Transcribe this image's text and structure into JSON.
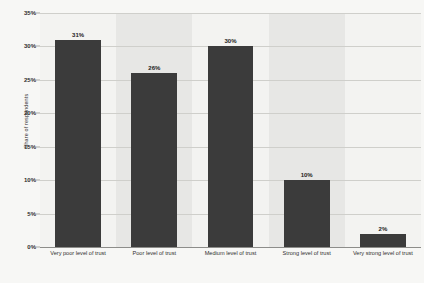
{
  "chart_data": {
    "type": "bar",
    "title": "",
    "subtitle": "",
    "xlabel": "",
    "ylabel": "Share of respondents",
    "ylim": [
      0,
      35
    ],
    "grid": true,
    "legend": "none",
    "categories": [
      "Very poor level of trust",
      "Poor level of trust",
      "Medium level of trust",
      "Strong level of trust",
      "Very strong level of trust"
    ],
    "values": [
      31,
      26,
      30,
      10,
      2
    ],
    "value_labels": [
      "31%",
      "26%",
      "30%",
      "10%",
      "2%"
    ],
    "ytick_values": [
      35,
      30,
      25,
      20,
      15,
      10,
      5,
      0
    ],
    "ytick_labels": [
      "35%",
      "30%",
      "25%",
      "20%",
      "15%",
      "10%",
      "5%",
      "0%"
    ],
    "colors": {
      "bar": "#3b3b3b",
      "band_light": "#f3f3f1",
      "band_dark": "#e7e7e5",
      "gridline": "#cfcfcb",
      "axis": "#8d8d8a",
      "background": "#f7f7f5",
      "text": "#2f2f2f"
    }
  }
}
